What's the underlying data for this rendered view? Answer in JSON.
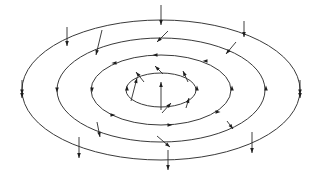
{
  "diagram": {
    "background": "#ffffff",
    "line_color": "#3a3a3a",
    "arrow_color": "#1e1e1e",
    "center": [
      161,
      90
    ],
    "rings": [
      {
        "id": "ring-outer",
        "rx": 139,
        "ry": 70
      },
      {
        "id": "ring-second",
        "rx": 104,
        "ry": 52
      },
      {
        "id": "ring-third",
        "rx": 70,
        "ry": 35
      },
      {
        "id": "ring-inner",
        "rx": 35,
        "ry": 17
      }
    ],
    "vectors": [
      {
        "ring": "outer",
        "x1": 161,
        "y1": 5,
        "x2": 161,
        "y2": 25
      },
      {
        "ring": "outer",
        "x1": 244,
        "y1": 21,
        "x2": 244,
        "y2": 37
      },
      {
        "ring": "outer",
        "x1": 67,
        "y1": 27,
        "x2": 67,
        "y2": 46
      },
      {
        "ring": "outer",
        "x1": 22,
        "y1": 80,
        "x2": 22,
        "y2": 98
      },
      {
        "ring": "outer",
        "x1": 300,
        "y1": 80,
        "x2": 300,
        "y2": 98
      },
      {
        "ring": "outer",
        "x1": 79,
        "y1": 137,
        "x2": 79,
        "y2": 158
      },
      {
        "ring": "outer",
        "x1": 252,
        "y1": 132,
        "x2": 252,
        "y2": 153
      },
      {
        "ring": "outer",
        "x1": 168,
        "y1": 150,
        "x2": 168,
        "y2": 170
      },
      {
        "ring": "second",
        "x1": 102,
        "y1": 30,
        "x2": 96,
        "y2": 55
      },
      {
        "ring": "second",
        "x1": 168,
        "y1": 31,
        "x2": 157,
        "y2": 42
      },
      {
        "ring": "second",
        "x1": 236,
        "y1": 42,
        "x2": 226,
        "y2": 54
      },
      {
        "ring": "second",
        "x1": 97,
        "y1": 122,
        "x2": 100,
        "y2": 137
      },
      {
        "ring": "second",
        "x1": 157,
        "y1": 136,
        "x2": 170,
        "y2": 147
      },
      {
        "ring": "second",
        "x1": 227,
        "y1": 121,
        "x2": 233,
        "y2": 129
      },
      {
        "ring": "inner",
        "x1": 131,
        "y1": 101,
        "x2": 137,
        "y2": 78
      },
      {
        "ring": "inner",
        "x1": 161,
        "y1": 110,
        "x2": 161,
        "y2": 82
      },
      {
        "ring": "inner",
        "x1": 162,
        "y1": 113,
        "x2": 171,
        "y2": 103
      },
      {
        "ring": "inner",
        "x1": 144,
        "y1": 82,
        "x2": 136,
        "y2": 72
      },
      {
        "ring": "inner",
        "x1": 163,
        "y1": 74,
        "x2": 155,
        "y2": 66
      },
      {
        "ring": "inner",
        "x1": 188,
        "y1": 82,
        "x2": 183,
        "y2": 71
      },
      {
        "ring": "inner",
        "x1": 186,
        "y1": 108,
        "x2": 189,
        "y2": 98
      }
    ],
    "flow_marks": [
      {
        "ring": "outer",
        "x": 22,
        "y": 92,
        "dir": "down"
      },
      {
        "ring": "outer",
        "x": 300,
        "y": 92,
        "dir": "down"
      },
      {
        "ring": "second",
        "x": 57,
        "y": 90,
        "dir": "down"
      },
      {
        "ring": "second",
        "x": 266,
        "y": 88,
        "dir": "up"
      },
      {
        "ring": "third",
        "x": 92,
        "y": 90,
        "dir": "down"
      },
      {
        "ring": "third",
        "x": 232,
        "y": 88,
        "dir": "up"
      },
      {
        "ring": "third",
        "x": 155,
        "y": 55,
        "dir": "left"
      },
      {
        "ring": "third",
        "x": 114,
        "y": 63,
        "dir": "left"
      },
      {
        "ring": "third",
        "x": 205,
        "y": 61,
        "dir": "left"
      },
      {
        "ring": "third",
        "x": 113,
        "y": 115,
        "dir": "right"
      },
      {
        "ring": "third",
        "x": 170,
        "y": 125,
        "dir": "right"
      },
      {
        "ring": "third",
        "x": 218,
        "y": 112,
        "dir": "right"
      },
      {
        "ring": "inner",
        "x": 127,
        "y": 88,
        "dir": "up"
      },
      {
        "ring": "inner",
        "x": 197,
        "y": 88,
        "dir": "up"
      }
    ]
  }
}
